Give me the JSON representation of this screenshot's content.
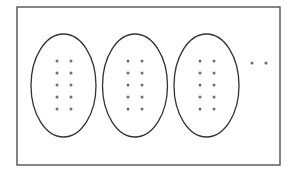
{
  "diagram": {
    "frame": {
      "x": 17,
      "y": 7,
      "width": 263,
      "height": 158,
      "stroke": "#444444"
    },
    "ellipse_stroke": "#333333",
    "dot_color": "#707070",
    "groups": [
      {
        "cx": 63.5,
        "cy": 85.5,
        "rx": 32.5,
        "ry": 51.5,
        "dot_cols": [
          57,
          71
        ],
        "dot_rows": [
          61,
          73,
          85,
          97,
          109
        ]
      },
      {
        "cx": 135,
        "cy": 85.5,
        "rx": 32.5,
        "ry": 51.5,
        "dot_cols": [
          128,
          142
        ],
        "dot_rows": [
          61,
          73,
          85,
          97,
          109
        ]
      },
      {
        "cx": 206.5,
        "cy": 85.5,
        "rx": 32.5,
        "ry": 51.5,
        "dot_cols": [
          200,
          214
        ],
        "dot_rows": [
          61,
          73,
          85,
          97,
          109
        ]
      }
    ],
    "ellipsis_dots": [
      {
        "x": 252,
        "y": 63
      },
      {
        "x": 266,
        "y": 63
      }
    ],
    "group_count_visible": 3,
    "dots_per_group": 10
  }
}
